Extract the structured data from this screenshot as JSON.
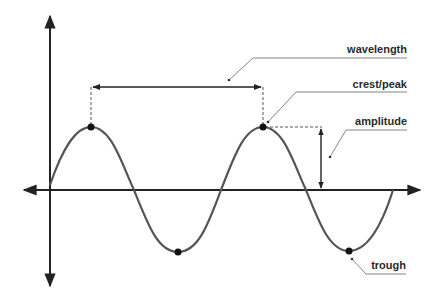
{
  "diagram": {
    "labels": {
      "wavelength": "wavelength",
      "crest": "crest/peak",
      "amplitude": "amplitude",
      "trough": "trough"
    },
    "colors": {
      "curve": "#555555",
      "axis": "#222222",
      "guide": "#666666"
    },
    "wave": {
      "x_start": 50,
      "x_end": 393,
      "axis_y": 190,
      "period_px": 172,
      "amplitude_px": 63
    },
    "points": {
      "crest_1": [
        91,
        127
      ],
      "crest_2": [
        263,
        127
      ],
      "trough_1": [
        178,
        252
      ],
      "trough_2": [
        349,
        251
      ]
    }
  }
}
